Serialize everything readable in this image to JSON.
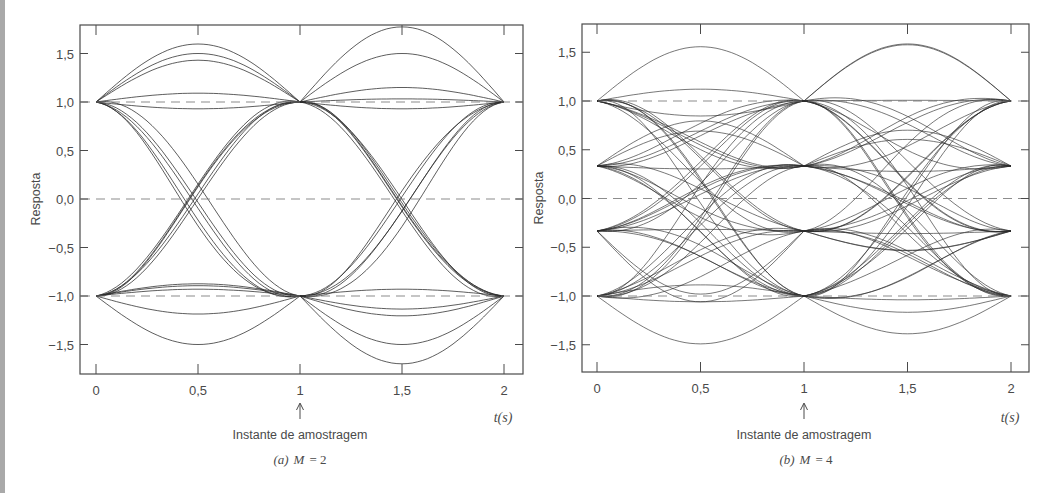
{
  "figure": {
    "panels": [
      {
        "id": "a",
        "caption_prefix": "(a)",
        "caption_var": "M",
        "caption_eq": "= 2",
        "ylabel": "Resposta",
        "xunit": "t(s)",
        "annotation": "Instante de amostragem",
        "yticks": [
          "1,5",
          "1,0",
          "0,5",
          "0,0",
          "−0,5",
          "−1,0",
          "−1,5"
        ],
        "xticks": [
          "0",
          "0,5",
          "1",
          "1,5",
          "2"
        ]
      },
      {
        "id": "b",
        "caption_prefix": "(b)",
        "caption_var": "M",
        "caption_eq": "= 4",
        "ylabel": "Resposta",
        "xunit": "t(s)",
        "annotation": "Instante de amostragem",
        "yticks": [
          "1,5",
          "1,0",
          "0,5",
          "0,0",
          "−0,5",
          "−1,0",
          "−1,5"
        ],
        "xticks": [
          "0",
          "0,5",
          "1",
          "1,5",
          "2"
        ]
      }
    ]
  },
  "chart_data": [
    {
      "type": "line",
      "title": "(a) M = 2",
      "subtitle": "Eye diagram (binary)",
      "xlabel": "t(s)",
      "ylabel": "Resposta",
      "xlim": [
        -0.08,
        2.08
      ],
      "ylim": [
        -1.8,
        1.8
      ],
      "xticks": [
        0,
        0.5,
        1,
        1.5,
        2
      ],
      "yticks": [
        1.5,
        1.0,
        0.5,
        0.0,
        -0.5,
        -1.0,
        -1.5
      ],
      "grid": false,
      "reference_lines_dashed": [
        1.0,
        0.0,
        -1.0
      ],
      "levels": [
        -1,
        1
      ],
      "sampling_instant": 1,
      "annotation": "Instante de amostragem",
      "eye_open_at_t1": true,
      "peak_overshoot": 1.5,
      "midpoint_values_between_equal_levels": [
        1.5,
        1.45,
        1.25,
        1.22,
        1.2,
        1.18,
        1.0,
        0.95,
        0.93
      ],
      "crossing_spread_at_t0_5": [
        -0.12,
        0.12
      ]
    },
    {
      "type": "line",
      "title": "(b) M = 4",
      "subtitle": "Eye diagram (quaternary)",
      "xlabel": "t(s)",
      "ylabel": "Resposta",
      "xlim": [
        -0.08,
        2.08
      ],
      "ylim": [
        -1.8,
        1.8
      ],
      "xticks": [
        0,
        0.5,
        1,
        1.5,
        2
      ],
      "yticks": [
        1.5,
        1.0,
        0.5,
        0.0,
        -0.5,
        -1.0,
        -1.5
      ],
      "grid": false,
      "reference_lines_dashed": [
        1.0,
        0.0,
        -1.0
      ],
      "levels": [
        -1,
        -0.333,
        0.333,
        1
      ],
      "sampling_instant": 1,
      "annotation": "Instante de amostragem",
      "eye_open_at_t1": true,
      "peak_overshoot": 1.4
    }
  ],
  "render": {
    "panel_a": {
      "frame": [
        80,
        25,
        523,
        374
      ],
      "x0": 96,
      "x2": 504,
      "y1": 102,
      "ym1": 296
    },
    "panel_b": {
      "frame": [
        582,
        24,
        1029,
        372
      ],
      "x0": 597,
      "x2": 1011,
      "y1": 101,
      "ym1": 296
    },
    "stroke": "#2b2b2b",
    "dash": "#7a7a7a"
  }
}
